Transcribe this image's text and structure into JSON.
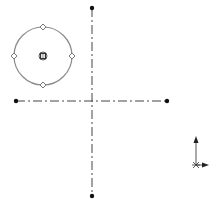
{
  "sketch": {
    "title": "CAD sketch view",
    "circle": {
      "cx": 43,
      "cy": 56,
      "r": 29,
      "stroke": "#8a8a8a",
      "center_marker": "concentric-square-point"
    },
    "quadrant_handles": [
      {
        "name": "top",
        "x": 43,
        "y": 27
      },
      {
        "name": "right",
        "x": 72,
        "y": 56
      },
      {
        "name": "bottom",
        "x": 43,
        "y": 85
      },
      {
        "name": "left",
        "x": 14,
        "y": 56
      }
    ],
    "centerlines": [
      {
        "name": "vertical",
        "x1": 92,
        "y1": 8,
        "x2": 92,
        "y2": 196
      },
      {
        "name": "horizontal",
        "x1": 16,
        "y1": 101,
        "x2": 167,
        "y2": 101
      }
    ],
    "endpoints": [
      {
        "x": 92,
        "y": 8
      },
      {
        "x": 92,
        "y": 196
      },
      {
        "x": 16,
        "y": 101
      },
      {
        "x": 167,
        "y": 101
      }
    ],
    "triad": {
      "origin_x": 196,
      "origin_y": 165,
      "up_y": 137,
      "right_x": 208,
      "color": "#333333"
    },
    "colors": {
      "line": "#444444",
      "circle": "#8a8a8a",
      "point": "#111111",
      "handle_fill": "#ffffff"
    }
  }
}
